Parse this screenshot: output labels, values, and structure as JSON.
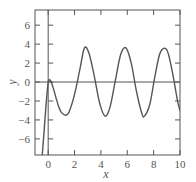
{
  "chart_data": {
    "type": "line",
    "title": "",
    "xlabel": "x",
    "ylabel": "y",
    "xlim": [
      -1,
      10
    ],
    "ylim": [
      -7.7,
      7.6
    ],
    "xticks": [
      0,
      2,
      4,
      6,
      8,
      10
    ],
    "yticks": [
      -6,
      -4,
      -2,
      0,
      2,
      4,
      6
    ],
    "xtick_labels": [
      "0",
      "2",
      "4",
      "6",
      "8",
      "10"
    ],
    "ytick_labels": [
      "−6",
      "−4",
      "−2",
      "0",
      "2",
      "4",
      "6"
    ],
    "reference_lines": {
      "x0_vertical": true,
      "y0_horizontal": true
    },
    "grid": false,
    "legend": null,
    "series": [
      {
        "name": "y(x)",
        "color": "#555555",
        "description": "Decaying transient plus steady oscillation, amplitude ~3.6, period ~3.14",
        "x": [
          -0.45,
          -0.3,
          -0.15,
          0,
          0.1,
          0.2,
          0.4,
          0.6,
          0.8,
          1.0,
          1.34,
          1.6,
          2.0,
          2.4,
          2.75,
          3.1,
          3.5,
          3.9,
          4.32,
          4.7,
          5.1,
          5.5,
          5.9,
          6.3,
          6.7,
          7.1,
          7.3,
          7.7,
          8.1,
          8.5,
          9.0,
          9.4,
          9.8,
          10.0
        ],
        "y": [
          -7.7,
          -5.0,
          -2.2,
          0.0,
          0.2,
          0.1,
          -0.7,
          -1.7,
          -2.6,
          -3.2,
          -3.5,
          -3.1,
          -1.3,
          1.3,
          3.6,
          3.0,
          0.6,
          -2.2,
          -3.6,
          -2.6,
          0.2,
          2.9,
          3.6,
          2.0,
          -1.0,
          -3.3,
          -3.6,
          -2.4,
          0.6,
          3.1,
          3.4,
          1.2,
          -1.9,
          -3.0
        ]
      }
    ]
  },
  "plot": {
    "frame_color": "#555555",
    "line_color": "#555555",
    "background": "#ffffff"
  }
}
